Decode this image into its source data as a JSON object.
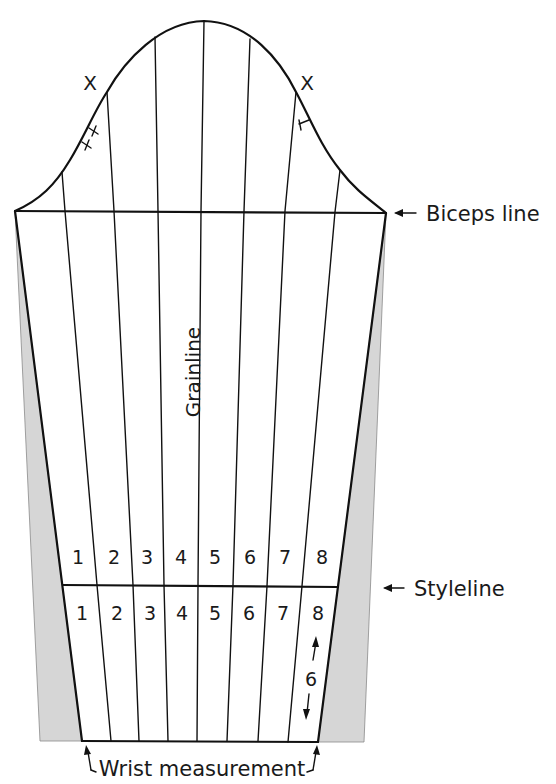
{
  "diagram": {
    "labels": {
      "biceps_line": "Biceps line",
      "styleline": "Styleline",
      "grainline": "Grainline",
      "wrist_measurement": "Wrist measurement",
      "spread_amount": "6"
    },
    "notch_marks": {
      "left": "X",
      "right": "X"
    },
    "upper_section_numbers": [
      "1",
      "2",
      "3",
      "4",
      "5",
      "6",
      "7",
      "8"
    ],
    "lower_section_numbers": [
      "1",
      "2",
      "3",
      "4",
      "5",
      "6",
      "7",
      "8"
    ],
    "colors": {
      "line": "#111111",
      "shaded_area": "#d6d6d6",
      "background": "#ffffff"
    }
  }
}
